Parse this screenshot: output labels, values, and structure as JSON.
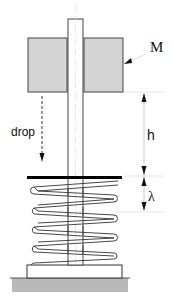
{
  "diagram": {
    "type": "drop-mass-on-spring",
    "labels": {
      "mass": "M",
      "drop": "drop",
      "height": "h",
      "compression": "λ"
    },
    "colors": {
      "mass_fill": "#d4d4d4",
      "ground_fill": "#b4b4b4",
      "stroke": "#333333",
      "plate": "#000000",
      "guide_line": "#cccccc"
    },
    "components": [
      {
        "id": "guide-rod",
        "description": "vertical guide rod"
      },
      {
        "id": "mass",
        "description": "mass block M sliding on rod"
      },
      {
        "id": "plate",
        "description": "thick top plate of spring"
      },
      {
        "id": "spring",
        "description": "helical spring, 4 coils"
      },
      {
        "id": "base",
        "description": "base block"
      },
      {
        "id": "ground",
        "description": "hatched ground"
      }
    ]
  }
}
